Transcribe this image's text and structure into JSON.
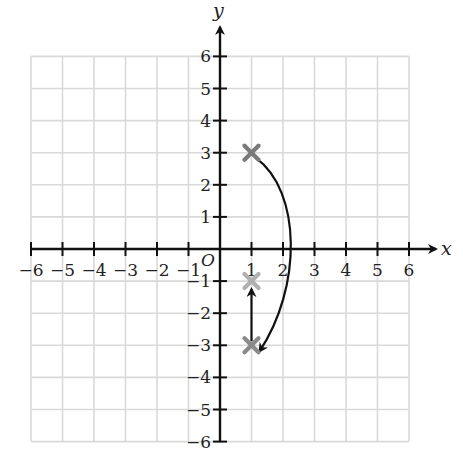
{
  "chart_data": {
    "type": "coordinate-plane",
    "title": "",
    "xlabel": "x",
    "ylabel": "y",
    "origin_label": "O",
    "xlim": [
      -6,
      6
    ],
    "ylim": [
      -6,
      6
    ],
    "grid": true,
    "x_ticks": [
      "-6",
      "-5",
      "-4",
      "-3",
      "-2",
      "-1",
      "1",
      "2",
      "3",
      "4",
      "5",
      "6"
    ],
    "y_ticks": [
      "6",
      "5",
      "4",
      "3",
      "2",
      "1",
      "-1",
      "-2",
      "-3",
      "-4",
      "-5",
      "-6"
    ],
    "points": [
      {
        "name": "start",
        "x": 1,
        "y": 3,
        "marker": "x",
        "color": "#7a7a7a"
      },
      {
        "name": "rotated",
        "x": 1,
        "y": -3,
        "marker": "x",
        "color": "#8a8a8a"
      },
      {
        "name": "final",
        "x": 1,
        "y": -1,
        "marker": "x",
        "color": "#b0b0b0"
      }
    ],
    "transformations": [
      {
        "type": "curved-arrow",
        "from": [
          1,
          3
        ],
        "to": [
          1,
          -3
        ],
        "description": "arc bulging right through about (2.3, 0)"
      },
      {
        "type": "straight-arrow",
        "from": [
          1,
          -3
        ],
        "to": [
          1,
          -1
        ]
      }
    ]
  },
  "colors": {
    "grid": "#d9d9d9",
    "axis": "#111111",
    "marker_dark": "#7a7a7a",
    "marker_light": "#b0b0b0"
  }
}
